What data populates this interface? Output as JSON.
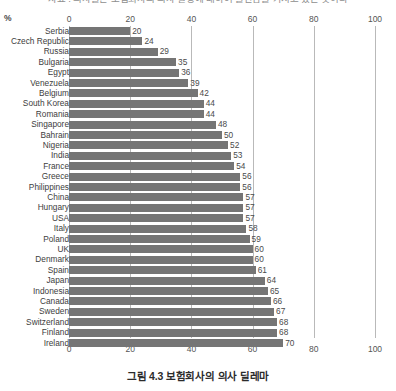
{
  "figure": {
    "clipped_title": "자료 : 의사들은 보험회사의 의사 결정에 대하여 불안감을 가지고 있는 것이다",
    "caption": "그림 4.3 보험회사의 의사 딜레마",
    "unit_label": "%"
  },
  "chart_data": {
    "type": "bar",
    "orientation": "horizontal",
    "title": "그림 4.3 보험회사의 의사 딜레마",
    "xlabel": "%",
    "ylabel": "",
    "xlim": [
      0,
      100
    ],
    "xticks": [
      0,
      20,
      40,
      60,
      80,
      100
    ],
    "grid": true,
    "legend": false,
    "bar_color": "#757575",
    "gridline_color": "#b9b9b9",
    "categories": [
      "Serbia",
      "Czech Republic",
      "Russia",
      "Bulgaria",
      "Egypt",
      "Venezuela",
      "Belgium",
      "South Korea",
      "Romania",
      "Singapore",
      "Bahrain",
      "Nigeria",
      "India",
      "France",
      "Greece",
      "Philippines",
      "China",
      "Hungary",
      "USA",
      "Italy",
      "Poland",
      "UK",
      "Denmark",
      "Spain",
      "Japan",
      "Indonesia",
      "Canada",
      "Sweden",
      "Switzerland",
      "Finland",
      "Ireland"
    ],
    "values": [
      20,
      24,
      29,
      35,
      36,
      39,
      42,
      44,
      44,
      48,
      50,
      52,
      53,
      54,
      56,
      56,
      57,
      57,
      57,
      58,
      59,
      60,
      60,
      61,
      64,
      65,
      66,
      67,
      68,
      68,
      70
    ]
  }
}
